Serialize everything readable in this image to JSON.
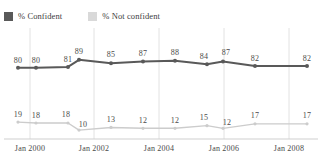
{
  "legend": {
    "entries": [
      {
        "label": "% Confident",
        "color": "#595959",
        "icon": "legend-swatch-dark"
      },
      {
        "label": "% Not confident",
        "color": "#d9d9d9",
        "icon": "legend-swatch-light"
      }
    ]
  },
  "chart_data": {
    "type": "line",
    "title": "",
    "subtitle": "",
    "xlabel": "",
    "ylabel": "",
    "grid": true,
    "legend_position": "top-left",
    "ylim": [
      0,
      100
    ],
    "x": [
      "Jan 2000",
      "Jan 2001",
      "Jan 2002",
      "Jan 2002b",
      "Jan 2003",
      "Jan 2004",
      "Jan 2005",
      "Jan 2006",
      "Jan 2007",
      "Jan 2008",
      "Jan 2009"
    ],
    "xtick_labels": [
      "Jan 2000",
      "Jan 2002",
      "Jan 2004",
      "Jan 2006",
      "Jan 2008"
    ],
    "series": [
      {
        "name": "% Confident",
        "color": "#595959",
        "values": [
          80,
          80,
          81,
          89,
          85,
          87,
          88,
          84,
          87,
          82,
          82
        ]
      },
      {
        "name": "% Not confident",
        "color": "#cccccc",
        "values": [
          19,
          18,
          18,
          10,
          13,
          12,
          12,
          15,
          12,
          17,
          17
        ]
      }
    ]
  },
  "layout": {
    "point_x": [
      18,
      36,
      68,
      79,
      111,
      143,
      175,
      207,
      223,
      255,
      307
    ],
    "gridline_x": [
      30,
      94,
      159,
      224,
      289
    ],
    "xtick_x": [
      30,
      94,
      159,
      224,
      289
    ],
    "label_offsets_top": [
      {
        "dx": 0,
        "dy": -12
      },
      {
        "dx": 0,
        "dy": -12
      },
      {
        "dx": 0,
        "dy": -12
      },
      {
        "dx": 0,
        "dy": -13
      },
      {
        "dx": 0,
        "dy": -13
      },
      {
        "dx": 0,
        "dy": -13
      },
      {
        "dx": 0,
        "dy": -13
      },
      {
        "dx": -3,
        "dy": -12
      },
      {
        "dx": 3,
        "dy": -14
      },
      {
        "dx": 0,
        "dy": -12
      },
      {
        "dx": 0,
        "dy": -12
      }
    ],
    "label_offsets_bottom": [
      {
        "dx": 0,
        "dy": -12
      },
      {
        "dx": 0,
        "dy": -12
      },
      {
        "dx": -2,
        "dy": -13
      },
      {
        "dx": 4,
        "dy": -10
      },
      {
        "dx": 0,
        "dy": -12
      },
      {
        "dx": 0,
        "dy": -12
      },
      {
        "dx": 0,
        "dy": -12
      },
      {
        "dx": -3,
        "dy": -13
      },
      {
        "dx": 4,
        "dy": -10
      },
      {
        "dx": 0,
        "dy": -13
      },
      {
        "dx": 0,
        "dy": -13
      }
    ],
    "baseline_y": 139,
    "plot_top": 28,
    "plot_height": 112
  }
}
